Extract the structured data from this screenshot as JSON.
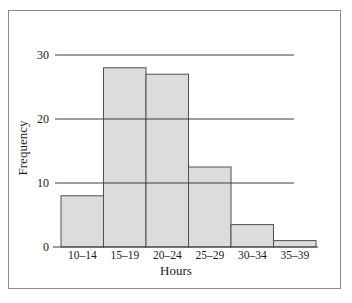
{
  "figure": {
    "xlabel": "Hours",
    "ylabel": "Frequency"
  },
  "chart_data": {
    "type": "bar",
    "chart_kind": "histogram",
    "title": "",
    "xlabel": "Hours",
    "ylabel": "Frequency",
    "categories": [
      "10–14",
      "15–19",
      "20–24",
      "25–29",
      "30–34",
      "35–39"
    ],
    "values": [
      8,
      28,
      27,
      12.5,
      3.5,
      1
    ],
    "yticks": [
      0,
      10,
      20,
      30
    ],
    "gridlines_at": [
      10,
      20,
      30
    ],
    "ylim": [
      0,
      32
    ],
    "grid": true,
    "legend": "none",
    "bar_gap": 0,
    "colors": {
      "bar_fill": "#dcdcda",
      "bar_stroke": "#4f4f4f",
      "grid_line": "#3f3f3f",
      "axis_line": "#3f3f3f",
      "text": "#1a1a1a",
      "frame_border": "#8c8c8c",
      "background": "#ffffff"
    }
  }
}
